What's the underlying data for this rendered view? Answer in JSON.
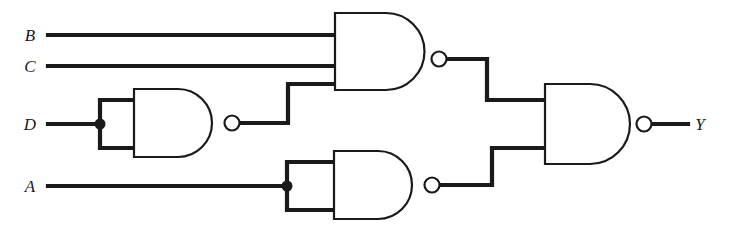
{
  "diagram": {
    "type": "logic-gate-schematic",
    "background_color": "#ffffff",
    "line_color": "#1a1a1a",
    "inputs": [
      {
        "id": "B",
        "label": "B",
        "label_x": 30,
        "label_y": 40,
        "wire_y": 35
      },
      {
        "id": "C",
        "label": "C",
        "label_x": 30,
        "label_y": 71,
        "wire_y": 66
      },
      {
        "id": "D",
        "label": "D",
        "label_x": 30,
        "label_y": 129,
        "wire_y": 124
      },
      {
        "id": "A",
        "label": "A",
        "label_x": 30,
        "label_y": 191,
        "wire_y": 186
      }
    ],
    "outputs": [
      {
        "id": "Y",
        "label": "Y",
        "label_x": 695,
        "label_y": 129,
        "wire_y": 124
      }
    ],
    "gates": [
      {
        "id": "gate-d-inverter",
        "type": "NAND",
        "inputs_count": 2,
        "note": "inputs tied together, acts as inverter on D",
        "body_left": 132,
        "body_right": 218,
        "body_top": 89,
        "body_bottom": 157,
        "bubble_x": 232,
        "bubble_y": 123,
        "bubble_r": 7.5
      },
      {
        "id": "gate-a-inverter",
        "type": "NAND",
        "inputs_count": 2,
        "note": "inputs tied together, acts as inverter on A",
        "body_left": 332,
        "body_right": 418,
        "body_top": 151,
        "body_bottom": 219,
        "bubble_x": 432,
        "bubble_y": 185,
        "bubble_r": 7.5
      },
      {
        "id": "gate-top-nand3",
        "type": "NAND",
        "inputs_count": 3,
        "note": "inputs B, C and inverted D",
        "body_left": 333,
        "body_right": 425,
        "body_top": 13,
        "body_bottom": 90,
        "bubble_x": 439,
        "bubble_y": 59,
        "bubble_r": 7.5
      },
      {
        "id": "gate-output-nand2",
        "type": "NAND",
        "inputs_count": 2,
        "note": "combines top NAND output and inverted A to produce Y",
        "body_left": 543,
        "body_right": 630,
        "body_top": 84,
        "body_bottom": 164,
        "bubble_x": 644,
        "bubble_y": 124,
        "bubble_r": 7.5
      }
    ],
    "junctions": [
      {
        "id": "junction-d",
        "x": 100,
        "y": 124,
        "r": 5.5
      },
      {
        "id": "junction-a",
        "x": 287,
        "y": 186,
        "r": 5.5
      }
    ],
    "nets": [
      {
        "id": "net-b",
        "name": "B to top NAND input 1",
        "path": "M 48 35 L 333 35"
      },
      {
        "id": "net-c",
        "name": "C to top NAND input 2",
        "path": "M 48 66 L 333 66"
      },
      {
        "id": "net-d",
        "name": "D to inverter tied inputs",
        "path": "M 48 124 L 100 124 M 100 100 L 100 148 M 100 100 L 134 100 M 100 148 L 134 148"
      },
      {
        "id": "net-dbar",
        "name": "D-inverter output to top NAND input 3",
        "path": "M 239 123 L 288 123 L 288 84 L 335 84"
      },
      {
        "id": "net-a",
        "name": "A to inverter tied inputs",
        "path": "M 48 186 L 287 186 M 287 162 L 287 210 M 287 162 L 334 162 M 287 210 L 334 210"
      },
      {
        "id": "net-top-out",
        "name": "Top NAND output to final NAND input 1",
        "path": "M 446 59 L 487 59 L 487 100 L 545 100"
      },
      {
        "id": "net-abar",
        "name": "A-inverter output to final NAND input 2",
        "path": "M 439 185 L 492 185 L 492 148 L 545 148"
      },
      {
        "id": "net-y",
        "name": "Final NAND output to Y",
        "path": "M 651 124 L 688 124"
      }
    ]
  }
}
